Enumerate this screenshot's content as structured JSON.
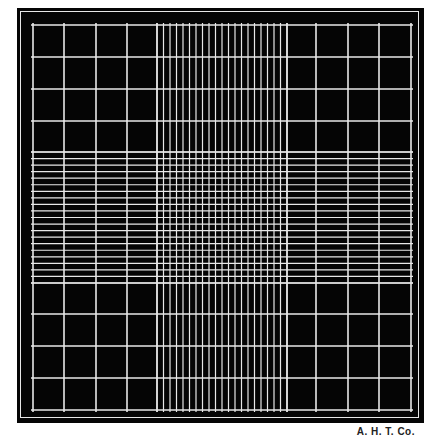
{
  "figure": {
    "caption": "A. H. T. Co.",
    "colors": {
      "background": "#050505",
      "lines": "#e8e8e8",
      "page": "#ffffff"
    },
    "grid": {
      "major_divisions": 12,
      "major_x": [
        33,
        64,
        96,
        127,
        157,
        287,
        316,
        348,
        379,
        411
      ],
      "major_y": [
        25,
        57,
        89,
        121,
        152,
        283,
        314,
        346,
        378,
        410
      ],
      "fine_band_x": [
        157,
        287
      ],
      "fine_band_y": [
        152,
        283
      ],
      "fine_lines_per_band": 21
    }
  }
}
